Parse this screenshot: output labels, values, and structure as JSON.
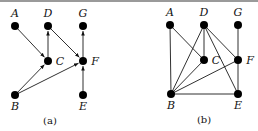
{
  "figure": {
    "panels": [
      {
        "id": "a",
        "caption": "(a)",
        "type": "directed",
        "nodes": [
          {
            "id": "A",
            "label": "A",
            "x": 15,
            "y": 26,
            "lx": 15,
            "ly": 17
          },
          {
            "id": "D",
            "label": "D",
            "x": 48,
            "y": 26,
            "lx": 48,
            "ly": 17
          },
          {
            "id": "G",
            "label": "G",
            "x": 83,
            "y": 26,
            "lx": 83,
            "ly": 17
          },
          {
            "id": "C",
            "label": "C",
            "x": 48,
            "y": 61,
            "lx": 60,
            "ly": 65
          },
          {
            "id": "F",
            "label": "F",
            "x": 83,
            "y": 61,
            "lx": 95,
            "ly": 65
          },
          {
            "id": "B",
            "label": "B",
            "x": 15,
            "y": 95,
            "lx": 15,
            "ly": 110
          },
          {
            "id": "E",
            "label": "E",
            "x": 83,
            "y": 95,
            "lx": 83,
            "ly": 110
          }
        ],
        "edges": [
          {
            "from": "A",
            "to": "C"
          },
          {
            "from": "B",
            "to": "C"
          },
          {
            "from": "B",
            "to": "F"
          },
          {
            "from": "C",
            "to": "D"
          },
          {
            "from": "D",
            "to": "F"
          },
          {
            "from": "F",
            "to": "G"
          },
          {
            "from": "E",
            "to": "F"
          }
        ],
        "caption_x": 50,
        "caption_y": 124
      },
      {
        "id": "b",
        "caption": "(b)",
        "type": "undirected",
        "nodes": [
          {
            "id": "A",
            "label": "A",
            "x": 170,
            "y": 25,
            "lx": 170,
            "ly": 16
          },
          {
            "id": "D",
            "label": "D",
            "x": 204,
            "y": 25,
            "lx": 204,
            "ly": 16
          },
          {
            "id": "G",
            "label": "G",
            "x": 238,
            "y": 25,
            "lx": 238,
            "ly": 16
          },
          {
            "id": "C",
            "label": "C",
            "x": 204,
            "y": 60,
            "lx": 216,
            "ly": 64
          },
          {
            "id": "F",
            "label": "F",
            "x": 238,
            "y": 60,
            "lx": 250,
            "ly": 64
          },
          {
            "id": "B",
            "label": "B",
            "x": 171,
            "y": 94,
            "lx": 171,
            "ly": 109
          },
          {
            "id": "E",
            "label": "E",
            "x": 238,
            "y": 94,
            "lx": 238,
            "ly": 109
          }
        ],
        "edges": [
          {
            "from": "A",
            "to": "B"
          },
          {
            "from": "A",
            "to": "C"
          },
          {
            "from": "D",
            "to": "C"
          },
          {
            "from": "D",
            "to": "B"
          },
          {
            "from": "D",
            "to": "F"
          },
          {
            "from": "D",
            "to": "E"
          },
          {
            "from": "G",
            "to": "F"
          },
          {
            "from": "F",
            "to": "E"
          },
          {
            "from": "F",
            "to": "B"
          },
          {
            "from": "C",
            "to": "B"
          },
          {
            "from": "B",
            "to": "E"
          }
        ],
        "caption_x": 204,
        "caption_y": 123
      }
    ],
    "colors": {
      "node": "#000000",
      "edge": "#1a1a1a",
      "border": "#9a9a9a"
    }
  }
}
